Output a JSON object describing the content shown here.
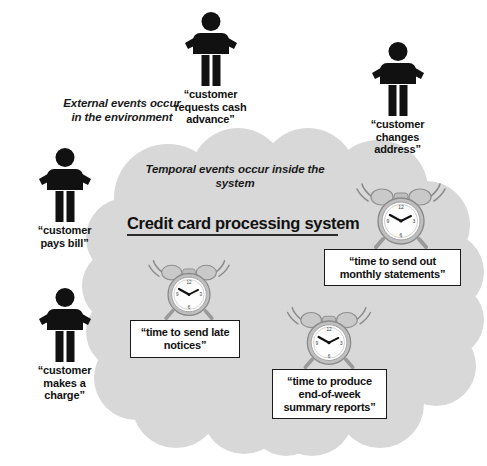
{
  "diagram": {
    "title": "Credit card processing system",
    "annotations": {
      "external": "External events\noccur in the\nenvironment",
      "temporal": "Temporal events occur\ninside the system"
    },
    "colors": {
      "cloud_fill": "#d9d9d9",
      "figure": "#111111",
      "box_border": "#1b1b1b",
      "box_fill": "#ffffff",
      "text": "#111111"
    }
  },
  "external_events": [
    {
      "id": "customer-requests-cash-advance",
      "icon": "person-icon",
      "label": "“customer\nrequests cash\nadvance”"
    },
    {
      "id": "customer-changes-address",
      "icon": "person-icon",
      "label": "“customer\nchanges\naddress”"
    },
    {
      "id": "customer-pays-bill",
      "icon": "person-icon",
      "label": "“customer\npays bill”"
    },
    {
      "id": "customer-makes-a-charge",
      "icon": "person-icon",
      "label": "“customer\nmakes a\ncharge”"
    }
  ],
  "temporal_events": [
    {
      "id": "monthly-statements",
      "icon": "alarm-clock-icon",
      "label": "“time to send out\nmonthly statements”"
    },
    {
      "id": "late-notices",
      "icon": "alarm-clock-icon",
      "label": "“time to send late\nnotices”"
    },
    {
      "id": "end-of-week-reports",
      "icon": "alarm-clock-icon",
      "label": "“time to produce\nend-of-week\nsummary reports”"
    }
  ]
}
